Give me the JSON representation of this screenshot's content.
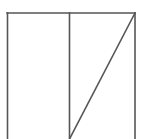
{
  "diagram": {
    "type": "geometric-figure",
    "stroke_color": "#555555",
    "background": "#ffffff",
    "shapes": {
      "outer_rect": {
        "x1": 7,
        "y1": 13,
        "x2": 135,
        "y2": 139
      },
      "divider": {
        "x": 69,
        "y1": 13,
        "y2": 139
      },
      "diagonal": {
        "x1": 135,
        "y1": 13,
        "x2": 69,
        "y2": 139
      }
    }
  }
}
